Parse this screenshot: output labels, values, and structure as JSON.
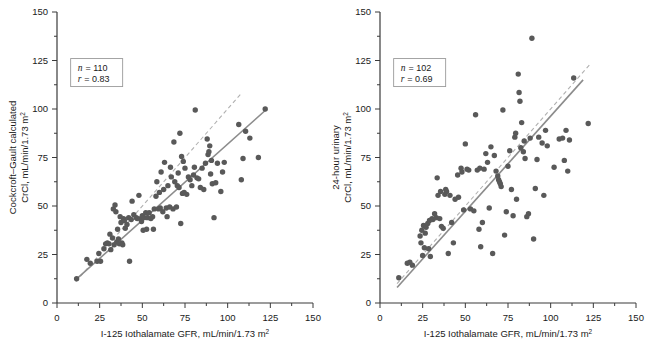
{
  "figure": {
    "panel_count": 2,
    "background_color": "#ffffff",
    "point_color": "#595959",
    "fit_line_color": "#8c8c8c",
    "identity_line_color": "#b0b0b0",
    "axis_color": "#3a3a3a"
  },
  "chart_data": [
    {
      "type": "scatter",
      "panel": "left",
      "title": "",
      "xlabel": "I-125 Iothalamate GFR, mL/min/1.73 m²",
      "ylabel": "Cockcroft–Gault calculated CrCl, mL/min/1.73 m²",
      "ylabel_line1": "Cockcroft–Gault calculated",
      "ylabel_line2": "CrCl, mL/min/1.73 m",
      "ylabel_line2_sup": "2",
      "xlabel_main": "I-125 Iothalamate GFR, mL/min/1.73 m",
      "xlabel_sup": "2",
      "xlim": [
        0,
        150
      ],
      "ylim": [
        0,
        150
      ],
      "xticks": [
        0,
        25,
        50,
        75,
        100,
        125,
        150
      ],
      "yticks": [
        0,
        25,
        50,
        75,
        100,
        125,
        150
      ],
      "xtick_labels": [
        "0",
        "25",
        "50",
        "75",
        "100",
        "125",
        "150"
      ],
      "ytick_labels": [
        "0",
        "25",
        "50",
        "75",
        "100",
        "125",
        "150"
      ],
      "minor_tick_step": 12.5,
      "grid": false,
      "legend": "none",
      "annotations": {
        "n_label": "n",
        "n_eq": "= 110",
        "n_value": 110,
        "r_label": "r",
        "r_eq": "= 0.83",
        "r_value": 0.83,
        "box_x": 8,
        "box_y": 126
      },
      "fit_line": {
        "style": "solid",
        "x0": 11,
        "y0": 12,
        "x1": 123,
        "y1": 100
      },
      "identity_line": {
        "style": "dashed",
        "x0": 11,
        "y0": 11,
        "x1": 108,
        "y1": 108
      },
      "points": [
        [
          11.5,
          12.5
        ],
        [
          17.5,
          22.5
        ],
        [
          19.5,
          20.5
        ],
        [
          23.5,
          21.5
        ],
        [
          24.5,
          25.5
        ],
        [
          25.5,
          21.5
        ],
        [
          27.5,
          28.0
        ],
        [
          28.5,
          30.5
        ],
        [
          29.5,
          31.0
        ],
        [
          30.5,
          30.5
        ],
        [
          31.0,
          35.5
        ],
        [
          31.5,
          27.5
        ],
        [
          32.5,
          33.5
        ],
        [
          33.0,
          48.5
        ],
        [
          33.5,
          30.0
        ],
        [
          34.0,
          50.5
        ],
        [
          34.5,
          47.0
        ],
        [
          35.0,
          31.5
        ],
        [
          35.5,
          38.0
        ],
        [
          36.0,
          33.0
        ],
        [
          36.5,
          30.5
        ],
        [
          37.0,
          44.5
        ],
        [
          37.5,
          41.5
        ],
        [
          38.0,
          31.0
        ],
        [
          38.5,
          30.0
        ],
        [
          39.0,
          43.5
        ],
        [
          39.5,
          42.5
        ],
        [
          40.0,
          38.5
        ],
        [
          41.0,
          40.5
        ],
        [
          42.0,
          44.0
        ],
        [
          42.5,
          21.5
        ],
        [
          43.5,
          43.0
        ],
        [
          44.0,
          52.5
        ],
        [
          45.0,
          45.5
        ],
        [
          46.5,
          44.0
        ],
        [
          47.0,
          43.5
        ],
        [
          48.0,
          55.5
        ],
        [
          49.0,
          43.5
        ],
        [
          49.5,
          42.0
        ],
        [
          50.0,
          45.0
        ],
        [
          50.5,
          37.5
        ],
        [
          51.0,
          44.0
        ],
        [
          52.0,
          46.5
        ],
        [
          52.5,
          38.0
        ],
        [
          53.0,
          44.0
        ],
        [
          54.0,
          46.5
        ],
        [
          55.0,
          43.5
        ],
        [
          56.0,
          44.5
        ],
        [
          56.5,
          38.0
        ],
        [
          57.0,
          48.5
        ],
        [
          58.0,
          55.0
        ],
        [
          58.5,
          62.5
        ],
        [
          59.5,
          48.5
        ],
        [
          60.0,
          57.0
        ],
        [
          60.5,
          49.0
        ],
        [
          61.0,
          67.5
        ],
        [
          62.0,
          47.0
        ],
        [
          62.5,
          58.5
        ],
        [
          63.0,
          72.5
        ],
        [
          64.0,
          49.0
        ],
        [
          64.5,
          44.5
        ],
        [
          65.0,
          60.5
        ],
        [
          66.0,
          49.5
        ],
        [
          66.5,
          70.0
        ],
        [
          67.0,
          65.0
        ],
        [
          68.0,
          48.5
        ],
        [
          68.5,
          83.0
        ],
        [
          69.0,
          62.5
        ],
        [
          70.0,
          49.5
        ],
        [
          70.5,
          60.5
        ],
        [
          71.0,
          67.0
        ],
        [
          71.5,
          59.5
        ],
        [
          72.0,
          87.5
        ],
        [
          72.5,
          41.0
        ],
        [
          73.0,
          75.5
        ],
        [
          73.5,
          56.5
        ],
        [
          74.0,
          73.0
        ],
        [
          74.5,
          57.0
        ],
        [
          75.0,
          69.5
        ],
        [
          76.0,
          56.0
        ],
        [
          77.0,
          65.0
        ],
        [
          78.0,
          63.5
        ],
        [
          79.0,
          60.5
        ],
        [
          80.0,
          66.0
        ],
        [
          80.5,
          70.0
        ],
        [
          81.0,
          99.5
        ],
        [
          82.0,
          64.5
        ],
        [
          83.0,
          64.0
        ],
        [
          84.0,
          59.5
        ],
        [
          85.0,
          69.5
        ],
        [
          86.0,
          58.5
        ],
        [
          87.0,
          72.0
        ],
        [
          88.0,
          84.5
        ],
        [
          88.5,
          76.5
        ],
        [
          89.0,
          78.0
        ],
        [
          89.5,
          81.0
        ],
        [
          90.0,
          66.5
        ],
        [
          90.5,
          73.5
        ],
        [
          91.0,
          61.5
        ],
        [
          92.0,
          44.0
        ],
        [
          93.0,
          62.0
        ],
        [
          94.0,
          72.0
        ],
        [
          96.0,
          57.5
        ],
        [
          97.0,
          67.5
        ],
        [
          98.0,
          72.5
        ],
        [
          106.5,
          92.0
        ],
        [
          108.0,
          63.5
        ],
        [
          109.0,
          74.5
        ],
        [
          110.5,
          88.5
        ],
        [
          113.0,
          85.0
        ],
        [
          118.0,
          75.0
        ],
        [
          122.0,
          100.0
        ]
      ]
    },
    {
      "type": "scatter",
      "panel": "right",
      "title": "",
      "xlabel": "I-125 Iothalamate GFR, mL/min/1.73 m²",
      "ylabel": "24-hour urinary CrCl, mL/min/1.73 m²",
      "ylabel_line1": "24-hour urinary",
      "ylabel_line2": "CrCl, mL/min/1.73 m",
      "ylabel_line2_sup": "2",
      "xlabel_main": "I-125 Iothalamate GFR, mL/min/1.73 m",
      "xlabel_sup": "2",
      "xlim": [
        0,
        150
      ],
      "ylim": [
        0,
        150
      ],
      "xticks": [
        0,
        25,
        50,
        75,
        100,
        125,
        150
      ],
      "yticks": [
        0,
        25,
        50,
        75,
        100,
        125,
        150
      ],
      "xtick_labels": [
        "0",
        "25",
        "50",
        "75",
        "100",
        "125",
        "150"
      ],
      "ytick_labels": [
        "0",
        "25",
        "50",
        "75",
        "100",
        "125",
        "150"
      ],
      "minor_tick_step": 12.5,
      "grid": false,
      "legend": "none",
      "annotations": {
        "n_label": "n",
        "n_eq": "= 102",
        "n_value": 102,
        "r_label": "r",
        "r_eq": "= 0.69",
        "r_value": 0.69,
        "box_x": 8,
        "box_y": 126
      },
      "fit_line": {
        "style": "solid",
        "x0": 10,
        "y0": 8,
        "x1": 119,
        "y1": 115
      },
      "identity_line": {
        "style": "dashed",
        "x0": 10,
        "y0": 10,
        "x1": 123,
        "y1": 123
      },
      "points": [
        [
          11.0,
          13.0
        ],
        [
          16.0,
          20.5
        ],
        [
          17.5,
          21.0
        ],
        [
          19.0,
          19.5
        ],
        [
          23.5,
          34.5
        ],
        [
          24.0,
          31.0
        ],
        [
          24.5,
          37.5
        ],
        [
          25.0,
          24.5
        ],
        [
          25.5,
          40.0
        ],
        [
          26.0,
          28.5
        ],
        [
          26.5,
          36.0
        ],
        [
          27.0,
          39.0
        ],
        [
          28.0,
          41.0
        ],
        [
          28.5,
          28.0
        ],
        [
          29.0,
          42.5
        ],
        [
          29.5,
          24.0
        ],
        [
          30.5,
          43.5
        ],
        [
          31.0,
          43.0
        ],
        [
          32.0,
          46.0
        ],
        [
          33.0,
          44.0
        ],
        [
          33.5,
          64.5
        ],
        [
          34.0,
          55.5
        ],
        [
          35.0,
          43.5
        ],
        [
          35.5,
          57.5
        ],
        [
          36.0,
          39.5
        ],
        [
          37.0,
          38.5
        ],
        [
          38.0,
          56.0
        ],
        [
          38.5,
          58.5
        ],
        [
          39.0,
          57.5
        ],
        [
          40.0,
          25.5
        ],
        [
          41.0,
          55.5
        ],
        [
          42.0,
          41.5
        ],
        [
          43.0,
          31.0
        ],
        [
          44.0,
          53.5
        ],
        [
          45.5,
          66.0
        ],
        [
          46.0,
          54.5
        ],
        [
          47.5,
          69.5
        ],
        [
          48.0,
          67.5
        ],
        [
          49.0,
          48.0
        ],
        [
          50.0,
          82.0
        ],
        [
          51.0,
          69.0
        ],
        [
          52.0,
          68.5
        ],
        [
          53.0,
          48.5
        ],
        [
          55.0,
          47.5
        ],
        [
          56.0,
          97.0
        ],
        [
          57.0,
          68.5
        ],
        [
          58.0,
          38.0
        ],
        [
          58.5,
          69.5
        ],
        [
          59.0,
          29.0
        ],
        [
          60.0,
          41.5
        ],
        [
          61.0,
          69.0
        ],
        [
          62.0,
          77.0
        ],
        [
          63.0,
          72.5
        ],
        [
          64.0,
          49.0
        ],
        [
          65.0,
          80.5
        ],
        [
          66.0,
          25.5
        ],
        [
          67.0,
          76.0
        ],
        [
          68.0,
          68.0
        ],
        [
          69.0,
          65.5
        ],
        [
          69.5,
          63.5
        ],
        [
          70.0,
          62.5
        ],
        [
          70.5,
          61.5
        ],
        [
          71.0,
          60.0
        ],
        [
          72.0,
          99.5
        ],
        [
          73.0,
          35.0
        ],
        [
          74.0,
          47.0
        ],
        [
          75.0,
          70.5
        ],
        [
          76.0,
          78.5
        ],
        [
          77.0,
          58.5
        ],
        [
          78.0,
          45.0
        ],
        [
          79.0,
          85.5
        ],
        [
          79.5,
          87.5
        ],
        [
          80.0,
          53.5
        ],
        [
          81.0,
          118.0
        ],
        [
          81.5,
          108.5
        ],
        [
          82.0,
          104.0
        ],
        [
          82.5,
          80.0
        ],
        [
          83.0,
          93.0
        ],
        [
          84.0,
          78.0
        ],
        [
          84.5,
          83.5
        ],
        [
          85.0,
          74.5
        ],
        [
          86.0,
          44.5
        ],
        [
          87.0,
          46.0
        ],
        [
          88.0,
          85.0
        ],
        [
          89.0,
          136.5
        ],
        [
          90.0,
          33.0
        ],
        [
          91.0,
          59.0
        ],
        [
          92.0,
          74.0
        ],
        [
          93.0,
          85.5
        ],
        [
          95.0,
          82.5
        ],
        [
          96.0,
          55.5
        ],
        [
          97.0,
          89.0
        ],
        [
          98.0,
          81.0
        ],
        [
          102.0,
          70.0
        ],
        [
          105.0,
          84.5
        ],
        [
          107.0,
          85.0
        ],
        [
          108.0,
          73.5
        ],
        [
          109.0,
          89.0
        ],
        [
          110.0,
          68.0
        ],
        [
          111.0,
          84.0
        ],
        [
          113.5,
          116.0
        ],
        [
          122.0,
          92.5
        ]
      ]
    }
  ]
}
